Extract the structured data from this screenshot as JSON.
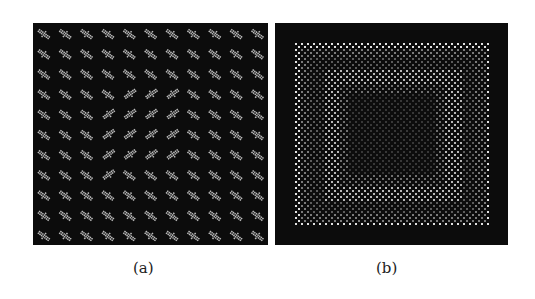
{
  "figure": {
    "panels": [
      {
        "id": "a",
        "caption": "(a)",
        "description": "Grid of bright oriented elongated blobs on dark background; blobs tilt down-right except a central V/chevron region where they tilt up-right",
        "grid": {
          "rows": 11,
          "cols": 11
        },
        "colors": {
          "background": "#0c0c0c",
          "foreground": "#f2f2f2"
        }
      },
      {
        "id": "b",
        "caption": "(b)",
        "description": "Dotted checker texture forming concentric square bands: dark outer border, bright outer frame, mid-bright ring, dark center",
        "colors": {
          "background": "#0c0c0c",
          "foreground": "#e8e8e8"
        }
      }
    ]
  }
}
